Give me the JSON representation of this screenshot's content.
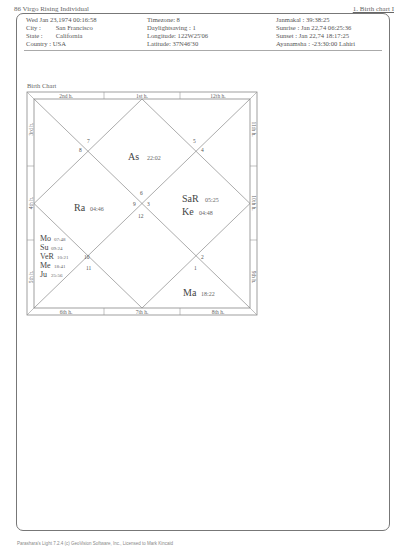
{
  "header": {
    "title_left": "86 Virgo Rising Individual",
    "title_right": "1. Birth chart I"
  },
  "birth_info": {
    "datetime": "Wed Jan 23,1974  00:16:58",
    "city_label": "City :",
    "city": "San Francisco",
    "state_label": "State :",
    "state": "California",
    "country_label": "Country :",
    "country": "USA",
    "timezone": "Timezone: 8",
    "daylight": "Daylightsaving : 1",
    "longitude": "Longitude: 122W25'06",
    "latitude": "Latitude: 37N46'30",
    "janmakal": "Janmakal : 39:38:25",
    "sunrise": "Sunrise : Jan 22,74  06:25:36",
    "sunset": "Sunset : Jan 22,74  18:17:25",
    "ayanamsha": "Ayanamsha : -23:30:00 Lahiri"
  },
  "chart": {
    "title": "Birth Chart",
    "houses_top": [
      "2nd h.",
      "1st h.",
      "12th h."
    ],
    "houses_left": [
      "3rd h.",
      "4th h.",
      "5th h."
    ],
    "houses_right": [
      "11th h.",
      "10th h.",
      "9th h."
    ],
    "houses_bottom": [
      "6th h.",
      "7th h.",
      "8th h."
    ],
    "sign_numbers": {
      "s7": "7",
      "s8": "8",
      "s5": "5",
      "s4": "4",
      "s6": "6",
      "s9": "9",
      "s3": "3",
      "s12": "12",
      "s10": "10",
      "s11": "11",
      "s2": "2",
      "s1": "1"
    },
    "planets": {
      "as": {
        "name": "As",
        "deg": "22:02"
      },
      "ra": {
        "name": "Ra",
        "deg": "04:46"
      },
      "sa": {
        "name": "SaR",
        "deg": "05:25"
      },
      "ke": {
        "name": "Ke",
        "deg": "04:48"
      },
      "mo": {
        "name": "Mo",
        "deg": "07:48"
      },
      "su": {
        "name": "Su",
        "deg": "09:24"
      },
      "ve": {
        "name": "VeR",
        "deg": "10:21"
      },
      "me": {
        "name": "Me",
        "deg": "18:41"
      },
      "ju": {
        "name": "Ju",
        "deg": "25:56"
      },
      "ma": {
        "name": "Ma",
        "deg": "18:22"
      }
    }
  },
  "footer": {
    "text": "Parashara's Light 7.2.4  (c) GeoVision Software, Inc., Licensed to Mark Kincaid"
  }
}
